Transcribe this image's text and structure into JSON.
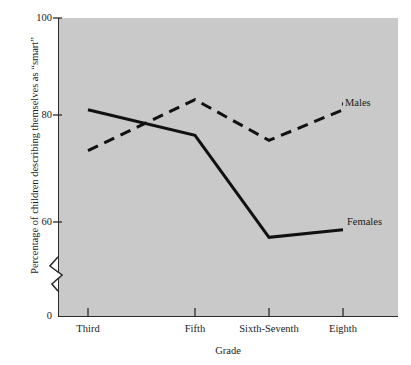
{
  "chart_data": {
    "type": "line",
    "title": "",
    "xlabel": "Grade",
    "ylabel": "Percentage of children describing themselves as \"smart\"",
    "categories": [
      "Third",
      "Fifth",
      "Sixth-Seventh",
      "Eighth"
    ],
    "series": [
      {
        "name": "Males",
        "values": [
          74,
          84,
          76,
          82
        ],
        "style": "dashed",
        "color": "#111111"
      },
      {
        "name": "Females",
        "values": [
          82,
          77,
          57,
          58.5
        ],
        "style": "solid",
        "color": "#111111"
      }
    ],
    "ylim": [
      0,
      100
    ],
    "yticks": [
      0,
      60,
      80,
      100
    ],
    "ytick_labels": [
      "0",
      "60",
      "80",
      "100"
    ],
    "axis_break": true,
    "axis_break_between": [
      0,
      55
    ],
    "grid": false,
    "legend_position": "inline-right-of-series",
    "plot_background": "#c9c9c9",
    "axis_color": "#2b2b2b"
  },
  "axis": {
    "y_labels": [
      "100",
      "80",
      "60",
      "0"
    ],
    "x_labels": [
      "Third",
      "Fifth",
      "Sixth-Seventh",
      "Eighth"
    ],
    "y_title": "Percentage of children describing themselves as “smart”",
    "x_title": "Grade"
  },
  "labels": {
    "males": "Males",
    "females": "Females"
  }
}
